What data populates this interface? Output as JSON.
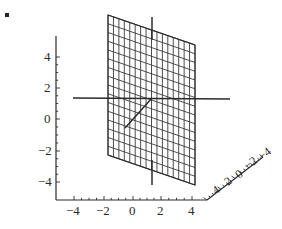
{
  "figure": {
    "kind": "3d-plot",
    "background_color": "#ffffff",
    "ink_color": "#2b2b2b",
    "mesh_color": "#3a3a3a",
    "stray_mark": {
      "name": "speck",
      "x": 5,
      "y": 13,
      "size": 4
    }
  },
  "chart_data": {
    "type": "line",
    "title": "",
    "subtitle": "",
    "xlabel": "",
    "ylabel": "",
    "zlabel": "",
    "grid": true,
    "legend": "none",
    "projection": "3d-parallel",
    "xlim": [
      -5,
      5
    ],
    "ylim": [
      -5,
      5
    ],
    "zlim": [
      -5,
      5
    ],
    "x_ticks": [
      "-4",
      "-2",
      "0",
      "2",
      "4"
    ],
    "y_ticks": [
      "4",
      "2",
      "0",
      "-2",
      "-4"
    ],
    "z_ticks": [
      "4",
      "2",
      "0",
      "-2",
      "-4"
    ],
    "x_tick_values": [
      -4,
      -2,
      0,
      2,
      4
    ],
    "y_tick_values": [
      4,
      2,
      0,
      -2,
      -4
    ],
    "z_tick_values": [
      4,
      2,
      0,
      -2,
      -4
    ],
    "surface": {
      "name": "vertical-mesh-plane",
      "description": "vertical planar mesh spanning x and y at constant depth",
      "mesh_rows": 16,
      "mesh_cols": 16,
      "corners": [
        [
          108,
          15
        ],
        [
          195,
          45
        ],
        [
          195,
          185
        ],
        [
          108,
          155
        ]
      ]
    },
    "axis_lines_through_plane": [
      {
        "name": "horizontal-axis-line",
        "from": [
          73,
          98
        ],
        "to": [
          230,
          99
        ]
      },
      {
        "name": "vertical-axis-line-top",
        "from": [
          152,
          17
        ],
        "to": [
          152,
          40
        ]
      },
      {
        "name": "vertical-axis-line-bottom",
        "from": [
          152,
          160
        ],
        "to": [
          152,
          185
        ]
      },
      {
        "name": "depth-axis-line",
        "from": [
          152,
          98
        ],
        "to": [
          125,
          128
        ]
      }
    ]
  },
  "axes": {
    "y_axis": {
      "name": "vertical-axis",
      "x": 56,
      "y_top": 36,
      "y_bottom": 200
    },
    "x_axis": {
      "name": "horizontal-axis",
      "y": 200,
      "x_left": 56,
      "x_right": 207
    },
    "z_axis": {
      "name": "depth-axis",
      "from": [
        207,
        200
      ],
      "to": [
        263,
        157
      ]
    }
  },
  "y_tick_labels": [
    {
      "text": "4",
      "x": 44,
      "y": 61
    },
    {
      "text": "2",
      "x": 44,
      "y": 92
    },
    {
      "text": "0",
      "x": 44,
      "y": 123
    },
    {
      "text": "-2",
      "x": 38,
      "y": 155
    },
    {
      "text": "-4",
      "x": 38,
      "y": 186
    }
  ],
  "x_tick_labels": [
    {
      "text": "-4",
      "x": 66,
      "y": 215
    },
    {
      "text": "-2",
      "x": 96,
      "y": 215
    },
    {
      "text": "0",
      "x": 129,
      "y": 215
    },
    {
      "text": "2",
      "x": 157,
      "y": 215
    },
    {
      "text": "4",
      "x": 188,
      "y": 215
    }
  ],
  "z_tick_labels": [
    {
      "text": "4",
      "x": 216,
      "y": 195
    },
    {
      "text": "2",
      "x": 228,
      "y": 186
    },
    {
      "text": "0",
      "x": 239,
      "y": 179
    },
    {
      "text": "-2",
      "x": 248,
      "y": 170
    },
    {
      "text": "-4",
      "x": 262,
      "y": 161
    }
  ]
}
